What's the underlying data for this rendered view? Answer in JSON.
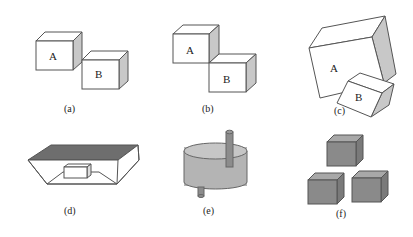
{
  "figure": {
    "panels": [
      {
        "id": "a",
        "caption": "(a)",
        "labels": [
          "A",
          "B"
        ],
        "description": "two white cubes A and B touching at an edge, B lower right"
      },
      {
        "id": "b",
        "caption": "(b)",
        "labels": [
          "A",
          "B"
        ],
        "description": "two white cubes A and B, B directly below-right sharing a corner"
      },
      {
        "id": "c",
        "caption": "(c)",
        "labels": [
          "A",
          "B"
        ],
        "description": "large tilted block A with smaller tilted block B embedded at lower right"
      },
      {
        "id": "d",
        "caption": "(d)",
        "labels": [],
        "description": "open box with dark lid and a small box inside"
      },
      {
        "id": "e",
        "caption": "(e)",
        "labels": [],
        "description": "grey cylinder disk with a rod through it"
      },
      {
        "id": "f",
        "caption": "(f)",
        "labels": [],
        "description": "three grey cubes arranged in a triangle"
      }
    ]
  },
  "colors": {
    "stroke": "#555555",
    "face_white": "#ffffff",
    "side_shade": "#c8c8c8",
    "dark_lid": "#6e6e6e",
    "grey_front": "#8a8a8a",
    "grey_top": "#a8a8a8",
    "grey_side": "#7a7a7a",
    "cyl_body": "#b4b4b4",
    "cyl_top": "#c6c6c6",
    "rod": "#8c8c8c"
  }
}
